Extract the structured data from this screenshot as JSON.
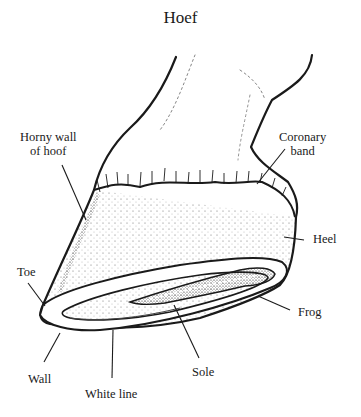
{
  "title": "Hoef",
  "labels": {
    "horny_wall": [
      "Horny wall",
      "of hoof"
    ],
    "coronary_band": [
      "Coronary",
      "band"
    ],
    "heel": "Heel",
    "toe": "Toe",
    "frog": "Frog",
    "wall": "Wall",
    "white_line": "White line",
    "sole": "Sole"
  },
  "colors": {
    "ink": "#1a1a1a",
    "background": "#ffffff"
  }
}
